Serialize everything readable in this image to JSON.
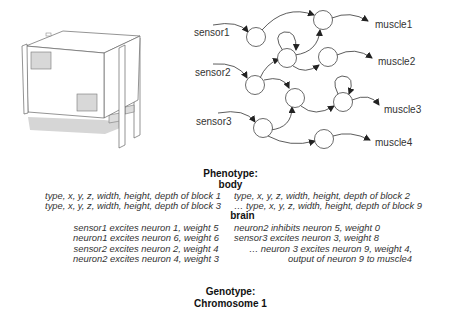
{
  "network": {
    "sensors": [
      "sensor1",
      "sensor2",
      "sensor3"
    ],
    "muscles": [
      "muscle1",
      "muscle2",
      "muscle3",
      "muscle4"
    ]
  },
  "phenotype": {
    "title": "Phenotype:",
    "body": {
      "title": "body",
      "left": [
        "type, x, y, z, width, height, depth of block 1",
        "type, x, y, z, width, height, depth of block 3"
      ],
      "right": [
        "type, x, y, z, width, height, depth of block 2",
        "… type, x, y, z, width, height, depth of block 9"
      ]
    },
    "brain": {
      "title": "brain",
      "left": [
        "sensor1 excites neuron 1, weight 5",
        "neuron1 excites neuron 6, weight 6",
        "sensor2 excites neuron 2, weight 4",
        "neuron2 excites neuron 4, weight 3"
      ],
      "right": [
        "neuron2 inhibits neuron 5, weight 0",
        "sensor3 excites neuron 3, weight 8",
        "… neuron 3 excites neuron 9, weight 4,",
        "output of neuron 9 to muscle4"
      ]
    }
  },
  "genotype": {
    "title": "Genotype:",
    "chromosome": "Chromosome 1"
  }
}
